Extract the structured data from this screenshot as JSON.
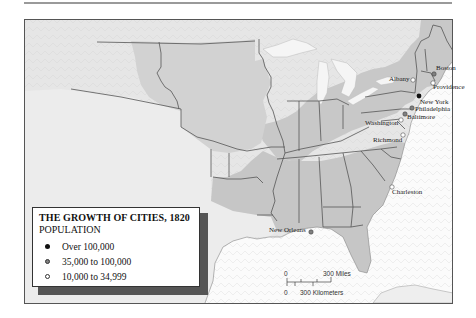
{
  "legend": {
    "title": "THE GROWTH OF CITIES, 1820",
    "subtitle": "POPULATION",
    "items": [
      {
        "label": "Over 100,000",
        "symbol": "filled-black-dot",
        "color": "#111111"
      },
      {
        "label": "35,000 to 100,000",
        "symbol": "filled-gray-dot",
        "color": "#808080"
      },
      {
        "label": "10,000 to 34,999",
        "symbol": "open-white-dot",
        "color": "#ffffff"
      }
    ]
  },
  "cities": [
    {
      "name": "Boston",
      "category": "35,000 to 100,000"
    },
    {
      "name": "Providence",
      "category": "10,000 to 34,999"
    },
    {
      "name": "Albany",
      "category": "10,000 to 34,999"
    },
    {
      "name": "New York",
      "category": "Over 100,000"
    },
    {
      "name": "Philadelphia",
      "category": "35,000 to 100,000"
    },
    {
      "name": "Baltimore",
      "category": "35,000 to 100,000"
    },
    {
      "name": "Washington",
      "category": "10,000 to 34,999"
    },
    {
      "name": "Richmond",
      "category": "10,000 to 34,999"
    },
    {
      "name": "Charleston",
      "category": "10,000 to 34,999"
    },
    {
      "name": "New Orleans",
      "category": "35,000 to 100,000"
    }
  ],
  "scale": {
    "miles_zero": "0",
    "miles_label": "300 Miles",
    "km_zero": "0",
    "km_label": "300 Kilometers"
  },
  "colors": {
    "over_100k": "#111111",
    "35k_100k": "#808080",
    "10k_35k": "#ffffff",
    "states_fill": "#c9c9c9",
    "territory_fill": "#dcdcdc",
    "water": "#fbfbfb"
  }
}
